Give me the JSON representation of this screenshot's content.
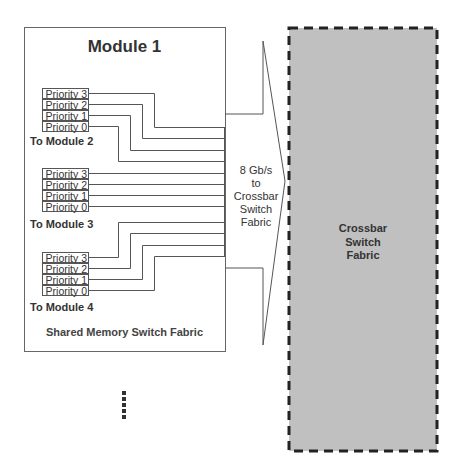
{
  "diagram": {
    "module": {
      "title": "Module 1",
      "footer": "Shared Memory Switch Fabric",
      "queue_groups": [
        {
          "destination": "To Module 2",
          "priorities": [
            "Priority 3",
            "Priority 2",
            "Priority 1",
            "Priority 0"
          ]
        },
        {
          "destination": "To Module 3",
          "priorities": [
            "Priority 3",
            "Priority 2",
            "Priority 1",
            "Priority 0"
          ]
        },
        {
          "destination": "To Module 4",
          "priorities": [
            "Priority 3",
            "Priority 2",
            "Priority 1",
            "Priority 0"
          ]
        }
      ]
    },
    "link": {
      "label_line1": "8 Gb/s",
      "label_line2": "to",
      "label_line3": "Crossbar",
      "label_line4": "Switch",
      "label_line5": "Fabric"
    },
    "crossbar": {
      "label_line1": "Crossbar",
      "label_line2": "Switch",
      "label_line3": "Fabric",
      "fill_color": "#c0c0c0",
      "border_style": "dashed"
    },
    "continuation": {
      "icon": "vertical-ellipsis-icon"
    },
    "colors": {
      "line": "#555555",
      "crossbar_fill": "#c0c0c0",
      "crossbar_border": "#222222"
    }
  }
}
